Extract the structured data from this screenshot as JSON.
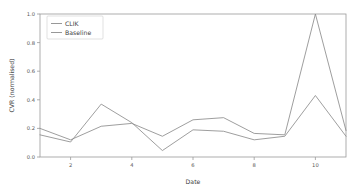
{
  "chart_data": {
    "type": "line",
    "title": "",
    "xlabel": "Date",
    "ylabel": "CVR (normalised)",
    "x": [
      1,
      2,
      3,
      4,
      5,
      6,
      7,
      8,
      9,
      10,
      11
    ],
    "xlim": [
      1,
      11
    ],
    "ylim": [
      0.0,
      1.0
    ],
    "xticks": [
      2,
      4,
      6,
      8,
      10
    ],
    "xticklabels": [
      "2",
      "4",
      "6",
      "8",
      "10"
    ],
    "yticks": [
      0.0,
      0.2,
      0.4,
      0.6,
      0.8,
      1.0
    ],
    "yticklabels": [
      "0.0",
      "0.2",
      "0.4",
      "0.6",
      "0.8",
      "1.0"
    ],
    "grid": false,
    "legend_position": "upper left",
    "series": [
      {
        "name": "CLIK",
        "color": "#8c8c8c",
        "values": [
          0.2,
          0.12,
          0.215,
          0.235,
          0.145,
          0.26,
          0.275,
          0.165,
          0.155,
          1.0,
          0.185
        ]
      },
      {
        "name": "Baseline",
        "color": "#8c8c8c",
        "values": [
          0.155,
          0.105,
          0.37,
          0.24,
          0.045,
          0.19,
          0.18,
          0.12,
          0.145,
          0.43,
          0.145
        ]
      }
    ]
  },
  "axis": {
    "xlabel": "Date",
    "ylabel": "CVR (normalised)",
    "xticklabels": [
      "2",
      "4",
      "6",
      "8",
      "10"
    ],
    "yticklabels": [
      "0.0",
      "0.2",
      "0.4",
      "0.6",
      "0.8",
      "1.0"
    ]
  },
  "legend": {
    "entries": [
      {
        "label": "CLIK"
      },
      {
        "label": "Baseline"
      }
    ]
  },
  "colors": {
    "background": "#ffffff",
    "axis": "#9a9a9a",
    "text": "#555555",
    "series_clik": "#8c8c8c",
    "series_baseline": "#8c8c8c"
  }
}
